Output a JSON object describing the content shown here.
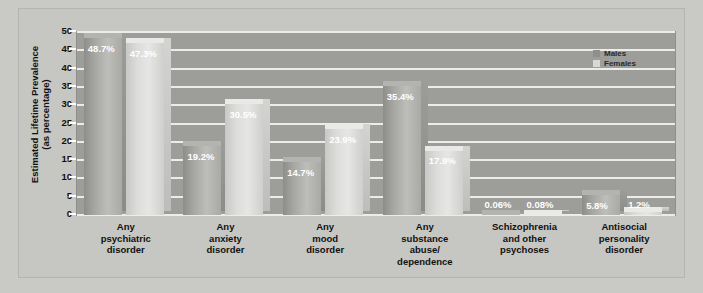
{
  "chart_data": {
    "type": "bar",
    "title": "",
    "xlabel": "",
    "ylabel": "Estimated Lifetime Prevalence (as percentage)",
    "ylabel_line1": "Estimated Lifetime Prevalence",
    "ylabel_line2": "(as percentage)",
    "ylim": [
      0,
      50
    ],
    "ytick_step": 5,
    "yticks": [
      "50",
      "45",
      "40",
      "35",
      "30",
      "25",
      "20",
      "15",
      "10",
      "5",
      "0"
    ],
    "grid": true,
    "legend_position": "top-right",
    "categories": [
      "Any psychiatric disorder",
      "Any anxiety disorder",
      "Any mood disorder",
      "Any substance abuse/ dependence",
      "Schizophrenia and other psychoses",
      "Antisocial personality disorder"
    ],
    "category_lines": [
      [
        "Any",
        "psychiatric",
        "disorder"
      ],
      [
        "Any",
        "anxiety",
        "disorder"
      ],
      [
        "Any",
        "mood",
        "disorder"
      ],
      [
        "Any",
        "substance",
        "abuse/",
        "dependence"
      ],
      [
        "Schizophrenia",
        "and other",
        "psychoses"
      ],
      [
        "Antisocial",
        "personality",
        "disorder"
      ]
    ],
    "series": [
      {
        "name": "Males",
        "color": "#a6a6a3",
        "values": [
          48.7,
          19.2,
          14.7,
          35.4,
          0.06,
          5.8
        ],
        "labels": [
          "48.7%",
          "19.2%",
          "14.7%",
          "35.4%",
          "0.06%",
          "5.8%"
        ]
      },
      {
        "name": "Females",
        "color": "#dcdcda",
        "values": [
          47.3,
          30.5,
          23.9,
          17.9,
          0.08,
          1.2
        ],
        "labels": [
          "47.3%",
          "30.5%",
          "23.9%",
          "17.9%",
          "0.08%",
          "1.2%"
        ]
      }
    ]
  },
  "legend": {
    "items": [
      {
        "label": "Males",
        "swatch": "male"
      },
      {
        "label": "Females",
        "swatch": "female"
      }
    ]
  }
}
